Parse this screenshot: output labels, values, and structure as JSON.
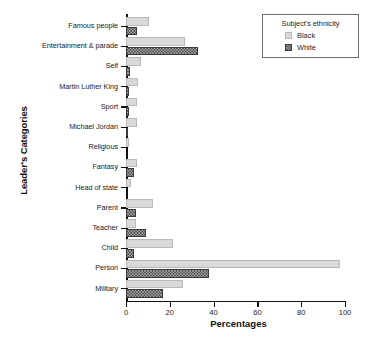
{
  "chart_data": {
    "type": "bar",
    "orientation": "horizontal",
    "title": "",
    "xlabel": "Percentages",
    "ylabel": "Leader's Categories",
    "xlim": [
      0,
      100
    ],
    "xticks": [
      0,
      20,
      40,
      60,
      80,
      100
    ],
    "grid": false,
    "legend": {
      "title": "Subject's ethnicity",
      "position": "top-right",
      "entries": [
        "Black",
        "White"
      ]
    },
    "categories": [
      "Famous people",
      "Entertainment & parade",
      "Self",
      "Martin Luther King",
      "Sport",
      "Michael Jordan",
      "Religious",
      "Fantasy",
      "Head of state",
      "Parent",
      "Teacher",
      "Child",
      "Person",
      "Military"
    ],
    "series": [
      {
        "name": "Black",
        "color": "#d9d9d9",
        "values": [
          10.5,
          27.0,
          7.0,
          5.5,
          5.0,
          5.0,
          1.5,
          5.0,
          2.5,
          12.5,
          4.5,
          21.5,
          97.5,
          26.0
        ]
      },
      {
        "name": "White",
        "color": "#585858",
        "values": [
          5.0,
          33.0,
          2.0,
          1.5,
          1.5,
          0.5,
          0.0,
          3.5,
          0.0,
          4.5,
          9.0,
          3.5,
          38.0,
          17.0
        ]
      }
    ]
  },
  "caption_remnant": " "
}
